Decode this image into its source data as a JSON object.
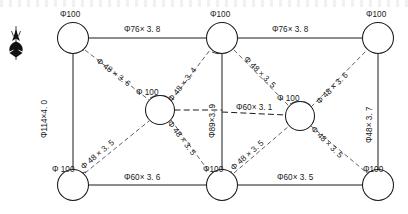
{
  "drawing": {
    "title": "Steel Tube Truss Member Schedule Diagram",
    "compass": {
      "name": "north-arrow",
      "label": "N"
    },
    "nodes": [
      {
        "id": "top-left",
        "label": "Φ100",
        "cx": 73,
        "cy": 38,
        "r": 15.5
      },
      {
        "id": "top-center",
        "label": "Φ100",
        "cx": 222,
        "cy": 38,
        "r": 15.5
      },
      {
        "id": "top-right",
        "label": "Φ100",
        "cx": 378,
        "cy": 38,
        "r": 15.5
      },
      {
        "id": "mid-left",
        "label": "Φ100",
        "cx": 160,
        "cy": 110,
        "r": 14.5
      },
      {
        "id": "mid-right",
        "label": "Φ100",
        "cx": 300,
        "cy": 116,
        "r": 14.5
      },
      {
        "id": "bottom-left",
        "label": "Φ100",
        "cx": 73,
        "cy": 185,
        "r": 15.5
      },
      {
        "id": "bottom-center",
        "label": "Φ100",
        "cx": 222,
        "cy": 185,
        "r": 15.5
      },
      {
        "id": "bottom-right",
        "label": "Φ100",
        "cx": 378,
        "cy": 185,
        "r": 15.5
      }
    ],
    "members": {
      "top_chord_left": "Φ76× 3. 8",
      "top_chord_right": "Φ76× 3. 8",
      "bottom_chord_left": "Φ60× 3. 6",
      "bottom_chord_right": "Φ60× 3. 5",
      "vertical_left": "Φ114×4. 0",
      "vertical_center": "Φ89×3. 9",
      "vertical_right": "Φ48× 3. 7",
      "middle_horizontal": "Φ60× 3. 1",
      "diagonal_tl_to_mid": "Φ 48 × 3. 6",
      "diagonal_mid_to_tc": "Φ 48 × 3. 4",
      "diagonal_tc_to_mr": "Φ 48 × 3. 5",
      "diagonal_mr_to_tr": "Φ 48 × 3. 6",
      "diagonal_bl_to_mid": "Φ 48 × 3. 5",
      "diagonal_mid_to_bc": "Φ 48 × 3. 5",
      "diagonal_bc_to_mr": "Φ 48 × 3. 5",
      "diagonal_mr_to_br": "Φ 48 × 3. 5"
    },
    "labels": {
      "node_top_left": "Φ100",
      "node_top_center": "Φ100",
      "node_top_right": "Φ100",
      "node_mid_left": "Φ 100",
      "node_mid_right": "Φ 100",
      "node_bottom_left": "Φ 100",
      "node_bottom_center": "Φ100",
      "node_bottom_right": "Φ100"
    },
    "colors": {
      "line": "#1a1a1a",
      "background": "#ffffff",
      "dashed": "#444444"
    }
  }
}
